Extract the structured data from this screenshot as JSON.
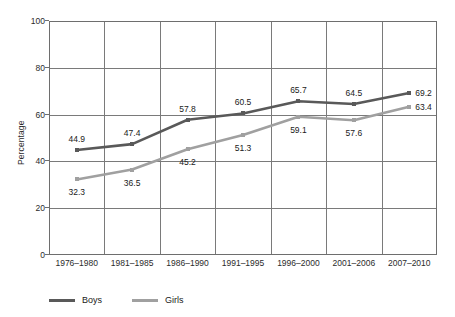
{
  "chart_data": {
    "type": "line",
    "title": "",
    "xlabel": "",
    "ylabel": "Percentage",
    "ylim": [
      0,
      100
    ],
    "yticks": [
      0,
      20,
      40,
      60,
      80,
      100
    ],
    "ytick_labels": [
      "0",
      "20",
      "40",
      "60",
      "80",
      "100"
    ],
    "grid": true,
    "legend_position": "bottom-left",
    "categories": [
      "1976–1980",
      "1981–1985",
      "1986–1990",
      "1991–1995",
      "1996–2000",
      "2001–2006",
      "2007–2010"
    ],
    "series": [
      {
        "name": "Boys",
        "color": "#595959",
        "marker": "square",
        "label_position": "above",
        "values": [
          44.9,
          47.4,
          57.8,
          60.5,
          65.7,
          64.5,
          69.2
        ],
        "value_labels": [
          "44.9",
          "47.4",
          "57.8",
          "60.5",
          "65.7",
          "64.5",
          "69.2"
        ]
      },
      {
        "name": "Girls",
        "color": "#a0a0a0",
        "marker": "square",
        "label_position": "below",
        "values": [
          32.3,
          36.5,
          45.2,
          51.3,
          59.1,
          57.6,
          63.4
        ],
        "value_labels": [
          "32.3",
          "36.5",
          "45.2",
          "51.3",
          "59.1",
          "57.6",
          "63.4"
        ]
      }
    ]
  },
  "colors": {
    "boys": "#595959",
    "girls": "#a0a0a0",
    "axis": "#6e6e6e",
    "grid": "#7a7a7a",
    "text": "#1a1a1a",
    "background": "#ffffff"
  }
}
